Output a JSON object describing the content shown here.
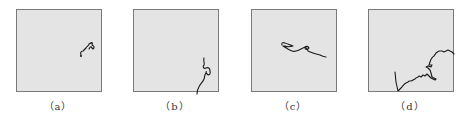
{
  "figure": {
    "panels": [
      {
        "id": "a",
        "label": "（a）",
        "description": "short curled trajectory near right-middle edge"
      },
      {
        "id": "b",
        "label": "（b）",
        "description": "wavy trajectory with small loop near bottom-right, exiting bottom edge"
      },
      {
        "id": "c",
        "label": "（c）",
        "description": "loop-and-tail trajectory in upper-middle, trending down-right"
      },
      {
        "id": "d",
        "label": "（d）",
        "description": "long jagged trajectory rising from bottom-left to upper-right"
      }
    ],
    "colors": {
      "panel_background": "#e4e4e4",
      "panel_border": "#7a7a7a",
      "trajectory": "#1a1a1a",
      "label_text": "#333333"
    }
  }
}
